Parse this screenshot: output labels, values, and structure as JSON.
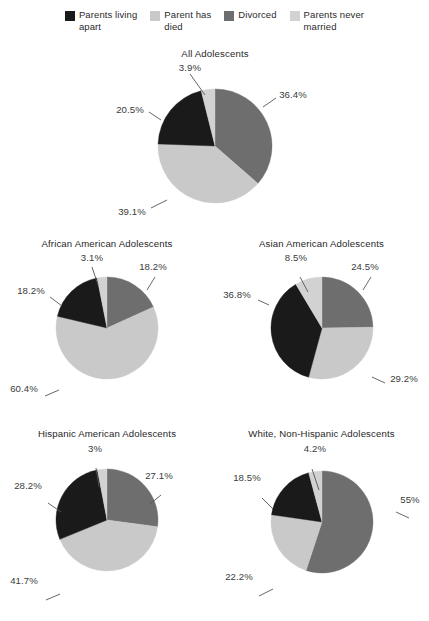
{
  "legend": {
    "items": [
      {
        "label": "Parents living\napart",
        "color": "#1a1a1a",
        "icon": "legend-swatch-icon"
      },
      {
        "label": "Parent has\ndied",
        "color": "#c9c9c9",
        "icon": "legend-swatch-icon"
      },
      {
        "label": "Divorced",
        "color": "#6e6e6e",
        "icon": "legend-swatch-icon"
      },
      {
        "label": "Parents never\nmarried",
        "color": "#d2d2d2",
        "icon": "legend-swatch-icon"
      }
    ]
  },
  "chart_data": {
    "type": "pie",
    "title": "",
    "categories": [
      "Divorced",
      "Parent has died",
      "Parents living apart",
      "Parents never married"
    ],
    "colors": [
      "#6e6e6e",
      "#c9c9c9",
      "#1a1a1a",
      "#d2d2d2"
    ],
    "legend_position": "top",
    "charts": [
      {
        "title": "All Adolescents",
        "values": [
          36.4,
          39.1,
          20.5,
          3.9
        ],
        "labels": [
          "36.4%",
          "39.1%",
          "20.5%",
          "3.9%"
        ]
      },
      {
        "title": "African American Adolescents",
        "values": [
          18.2,
          60.4,
          18.2,
          3.1
        ],
        "labels": [
          "18.2%",
          "60.4%",
          "18.2%",
          "3.1%"
        ]
      },
      {
        "title": "Asian American Adolescents",
        "values": [
          24.5,
          29.2,
          36.8,
          8.5
        ],
        "labels": [
          "24.5%",
          "29.2%",
          "36.8%",
          "8.5%"
        ]
      },
      {
        "title": "Hispanic American Adolescents",
        "values": [
          27.1,
          41.7,
          28.2,
          3.0
        ],
        "labels": [
          "27.1%",
          "41.7%",
          "28.2%",
          "3%"
        ]
      },
      {
        "title": "White, Non-Hispanic Adolescents",
        "values": [
          55.0,
          22.2,
          18.5,
          4.2
        ],
        "labels": [
          "55%",
          "22.2%",
          "18.5%",
          "4.2%"
        ]
      }
    ]
  }
}
